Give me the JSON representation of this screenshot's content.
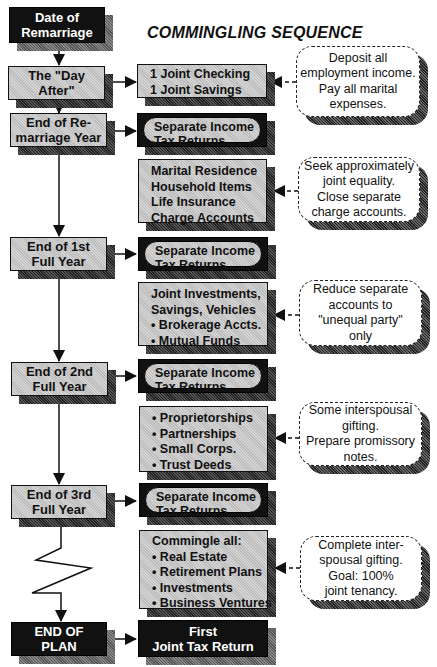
{
  "title": "COMMINGLING SEQUENCE",
  "timeline": [
    {
      "id": "date-of-remarriage",
      "lines": [
        "Date of",
        "Remarriage"
      ],
      "style": "black"
    },
    {
      "id": "day-after",
      "lines": [
        "The \"Day After\""
      ],
      "style": "gray"
    },
    {
      "id": "end-remarriage-year",
      "lines": [
        "End of Re-",
        "marriage Year"
      ],
      "style": "gray"
    },
    {
      "id": "end-1st-full-year",
      "lines": [
        "End of 1st",
        "Full Year"
      ],
      "style": "gray"
    },
    {
      "id": "end-2nd-full-year",
      "lines": [
        "End of 2nd",
        "Full Year"
      ],
      "style": "gray"
    },
    {
      "id": "end-3rd-full-year",
      "lines": [
        "End of 3rd",
        "Full Year"
      ],
      "style": "gray"
    },
    {
      "id": "end-of-plan",
      "lines": [
        "END OF",
        "PLAN"
      ],
      "style": "black"
    }
  ],
  "actions": [
    {
      "id": "joint-accounts",
      "lines": [
        "1 Joint Checking",
        "1 Joint Savings"
      ]
    },
    {
      "id": "tax-returns-1",
      "lines": [
        "Separate Income",
        "Tax Returns"
      ]
    },
    {
      "id": "marital-residence",
      "lines": [
        "Marital Residence",
        "Household Items",
        "Life Insurance",
        "Charge Accounts"
      ]
    },
    {
      "id": "tax-returns-2",
      "lines": [
        "Separate Income",
        "Tax Returns"
      ]
    },
    {
      "id": "joint-investments",
      "lines": [
        "Joint Investments,",
        "Savings, Vehicles",
        "• Brokerage Accts.",
        "• Mutual Funds"
      ]
    },
    {
      "id": "tax-returns-3",
      "lines": [
        "Separate Income",
        "Tax Returns"
      ]
    },
    {
      "id": "business-assets",
      "lines": [
        "• Proprietorships",
        "• Partnerships",
        "• Small Corps.",
        "• Trust Deeds"
      ]
    },
    {
      "id": "tax-returns-4",
      "lines": [
        "Separate Income",
        "Tax Returns"
      ]
    },
    {
      "id": "commingle-all",
      "lines": [
        "Commingle all:",
        "• Real Estate",
        "• Retirement Plans",
        "• Investments",
        "• Business Ventures"
      ]
    },
    {
      "id": "first-joint-return",
      "lines": [
        "First",
        "Joint Tax Return"
      ]
    }
  ],
  "notes": [
    {
      "id": "note-1",
      "lines": [
        "Deposit all",
        "employment income.",
        "Pay all marital",
        "expenses."
      ]
    },
    {
      "id": "note-2",
      "lines": [
        "Seek approximately",
        "joint equality.",
        "Close separate",
        "charge accounts."
      ]
    },
    {
      "id": "note-3",
      "lines": [
        "Reduce separate",
        "accounts to",
        "\"unequal party\"",
        "only"
      ]
    },
    {
      "id": "note-4",
      "lines": [
        "Some interspousal",
        "gifting.",
        "Prepare promissory",
        "notes."
      ]
    },
    {
      "id": "note-5",
      "lines": [
        "Complete inter-",
        "spousal gifting.",
        "Goal: 100%",
        "joint tenancy."
      ]
    }
  ]
}
